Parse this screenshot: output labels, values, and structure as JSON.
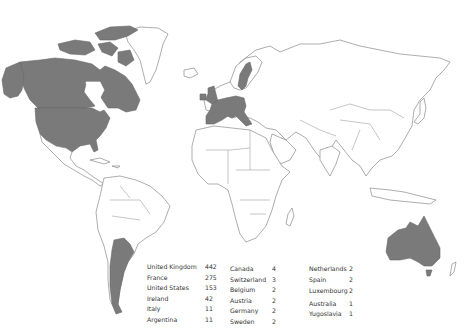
{
  "map": {
    "type": "world-choropleth",
    "highlight_color": "#7a7a7a",
    "outline_color": "#8a8a8a",
    "highlighted_countries": [
      "United Kingdom",
      "France",
      "United States",
      "Ireland",
      "Italy",
      "Argentina",
      "Canada",
      "Switzerland",
      "Belgium",
      "Austria",
      "Germany",
      "Sweden",
      "Netherlands",
      "Spain",
      "Luxembourg",
      "Australia",
      "Yugoslavia"
    ]
  },
  "legend": {
    "columns": [
      [
        {
          "country": "United Kingdom",
          "count": "442"
        },
        {
          "country": "France",
          "count": "275"
        },
        {
          "country": "United States",
          "count": "153"
        },
        {
          "country": "Ireland",
          "count": "42"
        },
        {
          "country": "Italy",
          "count": "11"
        },
        {
          "country": "Argentina",
          "count": "11"
        }
      ],
      [
        {
          "country": "Canada",
          "count": "4"
        },
        {
          "country": "Switzerland",
          "count": "3"
        },
        {
          "country": "Belgium",
          "count": "2"
        },
        {
          "country": "Austria",
          "count": "2"
        },
        {
          "country": "Germany",
          "count": "2"
        },
        {
          "country": "Sweden",
          "count": "2"
        }
      ],
      [
        {
          "country": "Netherlands",
          "count": "2"
        },
        {
          "country": "Spain",
          "count": "2"
        },
        {
          "country": "Luxembourg",
          "count": "2"
        },
        {
          "country": "Australia",
          "count": "1"
        },
        {
          "country": "Yugoslavia",
          "count": "1"
        }
      ]
    ]
  }
}
